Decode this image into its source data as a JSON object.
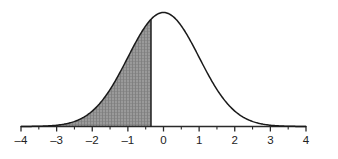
{
  "figure": {
    "title": ""
  },
  "chart_data": {
    "type": "area",
    "title": "",
    "subtitle": "",
    "xlabel": "",
    "ylabel": "",
    "xlim": [
      -4,
      4
    ],
    "ylim": [
      0,
      0.45
    ],
    "grid": false,
    "legend": null,
    "curve": {
      "name": "standard normal density",
      "distribution": "normal",
      "mean": 0,
      "sd": 1,
      "peak_x": 0,
      "peak_y": 0.3989
    },
    "shaded_region": {
      "label": "",
      "from": -4,
      "to": -0.35,
      "fill": "#8c8c8c",
      "pattern": "hatch",
      "boundary_line_x": -0.35
    },
    "x_major_ticks": [
      -4,
      -3,
      -2,
      -1,
      0,
      1,
      2,
      3,
      4
    ],
    "x_tick_labels": [
      "–4",
      "–3",
      "–2",
      "–1",
      "0",
      "1",
      "2",
      "3",
      "4"
    ],
    "x_minor_ticks": [
      -3.5,
      -2.5,
      -1.5,
      -0.5,
      0.5,
      1.5,
      2.5,
      3.5
    ],
    "axis_color": "#2a2a2a",
    "curve_color": "#1a1a1a",
    "background": "#ffffff",
    "x": [
      -4,
      -3.8,
      -3.6,
      -3.4,
      -3.2,
      -3,
      -2.8,
      -2.6,
      -2.4,
      -2.2,
      -2,
      -1.8,
      -1.6,
      -1.4,
      -1.2,
      -1,
      -0.8,
      -0.6,
      -0.4,
      -0.2,
      0,
      0.2,
      0.4,
      0.6,
      0.8,
      1,
      1.2,
      1.4,
      1.6,
      1.8,
      2,
      2.2,
      2.4,
      2.6,
      2.8,
      3,
      3.2,
      3.4,
      3.6,
      3.8,
      4
    ],
    "y": [
      0.0001,
      0.0003,
      0.0006,
      0.0012,
      0.0024,
      0.0044,
      0.0079,
      0.0136,
      0.0224,
      0.0355,
      0.054,
      0.079,
      0.1109,
      0.1497,
      0.1942,
      0.242,
      0.2897,
      0.3332,
      0.3683,
      0.391,
      0.3989,
      0.391,
      0.3683,
      0.3332,
      0.2897,
      0.242,
      0.1942,
      0.1497,
      0.1109,
      0.079,
      0.054,
      0.0355,
      0.0224,
      0.0136,
      0.0079,
      0.0044,
      0.0024,
      0.0012,
      0.0006,
      0.0003,
      0.0001
    ]
  }
}
